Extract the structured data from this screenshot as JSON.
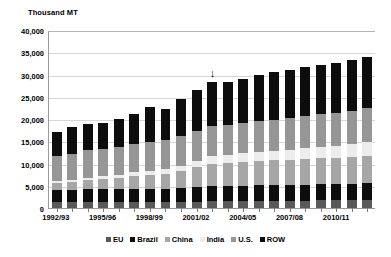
{
  "chart_data": {
    "type": "bar",
    "subtype": "stacked-column",
    "title": "",
    "ylabel": "Thousand MT",
    "xlabel": "",
    "ylim": [
      0,
      40000
    ],
    "ytick_step": 5000,
    "ytick_labels": [
      "40,000",
      "35,000",
      "30,000",
      "25,000",
      "20,000",
      "15,000",
      "10,000",
      "5,000",
      "0"
    ],
    "ytick_values": [
      40000,
      35000,
      30000,
      25000,
      20000,
      15000,
      10000,
      5000,
      0
    ],
    "grid": true,
    "legend_position": "bottom",
    "categories": [
      "1992/93",
      "1993/94",
      "1994/95",
      "1995/96",
      "1996/97",
      "1997/98",
      "1998/99",
      "1999/00",
      "2000/01",
      "2001/02",
      "2002/03",
      "2003/04",
      "2004/05",
      "2005/06",
      "2006/07",
      "2007/08",
      "2008/09",
      "2009/10",
      "2010/11",
      "2011/12",
      "2012/13"
    ],
    "xtick_labels_shown": [
      "1992/93",
      "1995/96",
      "1998/99",
      "2001/02",
      "2004/05",
      "2007/08",
      "2010/11"
    ],
    "xtick_label_indices": [
      0,
      3,
      6,
      9,
      12,
      15,
      18
    ],
    "series": [
      {
        "name": "EU",
        "color": "#595959",
        "values": [
          1400,
          1400,
          1400,
          1400,
          1400,
          1400,
          1350,
          1350,
          1400,
          1450,
          1500,
          1500,
          1550,
          1600,
          1600,
          1650,
          1650,
          1700,
          1700,
          1750,
          1800
        ]
      },
      {
        "name": "Brazil",
        "color": "#0d0d0d",
        "values": [
          2700,
          2700,
          2800,
          2800,
          2800,
          2900,
          2950,
          3000,
          3150,
          3300,
          3400,
          3450,
          3500,
          3500,
          3550,
          3550,
          3600,
          3650,
          3700,
          3750,
          3850
        ]
      },
      {
        "name": "China",
        "color": "#a6a6a6",
        "values": [
          1450,
          1750,
          2050,
          2300,
          2550,
          2950,
          3150,
          3350,
          3800,
          4400,
          5000,
          5200,
          5350,
          5450,
          5550,
          5650,
          5750,
          5800,
          5900,
          6000,
          6100
        ]
      },
      {
        "name": "India",
        "color": "#ededed",
        "values": [
          450,
          500,
          550,
          600,
          700,
          850,
          950,
          1050,
          1200,
          1500,
          1750,
          1800,
          1900,
          2000,
          2100,
          2250,
          2400,
          2550,
          2700,
          2850,
          3000
        ]
      },
      {
        "name": "U.S.",
        "color": "#969696",
        "values": [
          5600,
          5900,
          6200,
          6200,
          6250,
          6300,
          6400,
          6450,
          6550,
          6600,
          6700,
          6750,
          6850,
          6950,
          7050,
          7150,
          7250,
          7350,
          7450,
          7550,
          7650
        ]
      },
      {
        "name": "ROW",
        "color": "#0d0d0d",
        "values": [
          5400,
          5950,
          6000,
          5900,
          6400,
          6700,
          7900,
          7000,
          8450,
          9350,
          9950,
          9600,
          9850,
          10400,
          10650,
          10800,
          11000,
          11000,
          11050,
          11300,
          11600
        ]
      }
    ],
    "totals": [
      17000,
      18200,
      19000,
      19200,
      20100,
      21100,
      22700,
      22200,
      24550,
      26600,
      28300,
      28300,
      29000,
      29900,
      30500,
      31050,
      31650,
      32050,
      32500,
      33200,
      34000
    ],
    "annotations": [
      {
        "type": "arrow-down",
        "category": "2002/03",
        "category_index": 10,
        "value": 31500
      }
    ]
  }
}
